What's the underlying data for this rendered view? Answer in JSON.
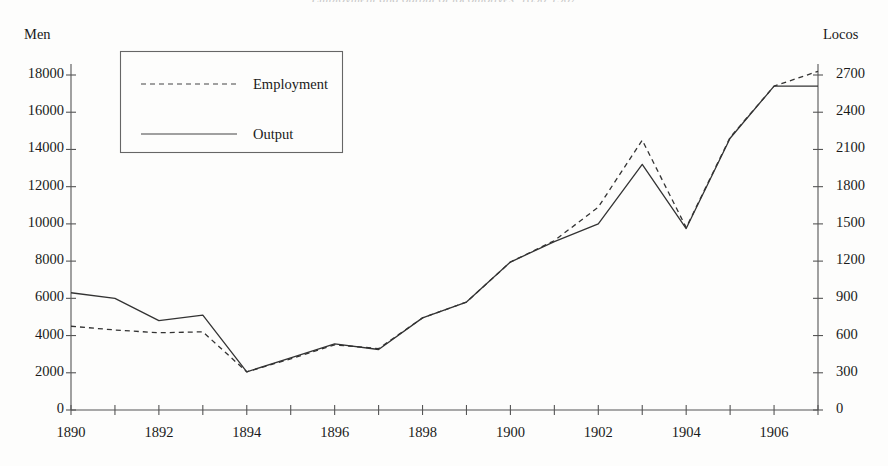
{
  "figure": {
    "title_remnant": "Employment and output of locomotives, 1890-1907",
    "background_color": "#fdfdfc",
    "ink_color": "#333333"
  },
  "legend": {
    "position": "top-left-inside",
    "entries": [
      {
        "label": "Employment",
        "style": "dashed"
      },
      {
        "label": "Output",
        "style": "solid"
      }
    ]
  },
  "axes": {
    "left": {
      "name": "Men",
      "ticks": [
        "0",
        "2000",
        "4000",
        "6000",
        "8000",
        "10000",
        "12000",
        "14000",
        "16000",
        "18000"
      ]
    },
    "right": {
      "name": "Locos",
      "ticks": [
        "0",
        "300",
        "600",
        "900",
        "1200",
        "1500",
        "1800",
        "2100",
        "2400",
        "2700"
      ]
    },
    "bottom": {
      "ticks": [
        "1890",
        "1892",
        "1894",
        "1896",
        "1898",
        "1900",
        "1902",
        "1904",
        "1906"
      ]
    }
  },
  "chart_data": {
    "type": "line",
    "title": "Employment and output of locomotives, 1890-1907",
    "xlabel": "",
    "ylabel": "Men",
    "y2label": "Locos",
    "xlim": [
      1890,
      1907
    ],
    "ylim": [
      0,
      18000
    ],
    "y2lim": [
      0,
      2700
    ],
    "grid": false,
    "legend_position": "upper left",
    "x": [
      1890,
      1891,
      1892,
      1893,
      1894,
      1895,
      1896,
      1897,
      1898,
      1899,
      1900,
      1901,
      1902,
      1903,
      1904,
      1905,
      1906,
      1907
    ],
    "series": [
      {
        "name": "Employment",
        "axis": "left",
        "unit": "men",
        "style": "dashed",
        "values": [
          4500,
          4300,
          4150,
          4200,
          2050,
          2750,
          3500,
          3300,
          4950,
          5800,
          7950,
          9100,
          10900,
          14500,
          9800,
          14650,
          17400,
          18200
        ]
      },
      {
        "name": "Output",
        "axis": "right",
        "unit": "locos",
        "style": "solid",
        "values_locos": [
          945,
          900,
          790,
          765,
          310,
          420,
          535,
          490,
          745,
          870,
          1195,
          1355,
          1500,
          1980,
          1460,
          2195,
          2610,
          2610
        ],
        "values_men_equivalent": [
          6300,
          6000,
          4800,
          5100,
          2050,
          2800,
          3550,
          3250,
          4950,
          5800,
          7950,
          9050,
          10000,
          13200,
          9750,
          14600,
          17400,
          17400
        ]
      }
    ]
  }
}
